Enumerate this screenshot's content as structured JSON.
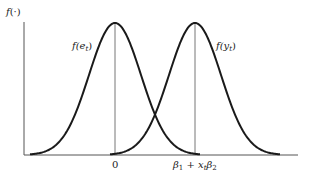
{
  "figure": {
    "ylabel_func": "f",
    "ylabel_arg": "(·)",
    "curve_left_label_f": "f",
    "curve_left_label_arg": "(e",
    "curve_left_label_sub": "t",
    "curve_left_label_close": ")",
    "curve_right_label_f": "f",
    "curve_right_label_arg": "(y",
    "curve_right_label_sub": "t",
    "curve_right_label_close": ")",
    "tick_left": "0",
    "tick_right_b1": "β",
    "tick_right_b1_sub": "1",
    "tick_right_plus": " + x",
    "tick_right_x_sub": "t",
    "tick_right_b2": "β",
    "tick_right_b2_sub": "2"
  },
  "chart_data": {
    "type": "line",
    "title": "",
    "xlabel": "",
    "ylabel": "f(·)",
    "grid": false,
    "series": [
      {
        "name": "f(e_t)",
        "center_label": "0",
        "distribution": "normal",
        "peak_x_px": 115
      },
      {
        "name": "f(y_t)",
        "center_label": "β_1 + x_t β_2",
        "distribution": "normal",
        "peak_x_px": 195
      }
    ],
    "x_ticks": [
      "0",
      "β_1 + x_t β_2"
    ],
    "annotations": [
      "vertical line at mean of each density"
    ]
  },
  "colors": {
    "curve": "#1a1a1a",
    "axis": "#555555",
    "mean_line": "#666666"
  }
}
